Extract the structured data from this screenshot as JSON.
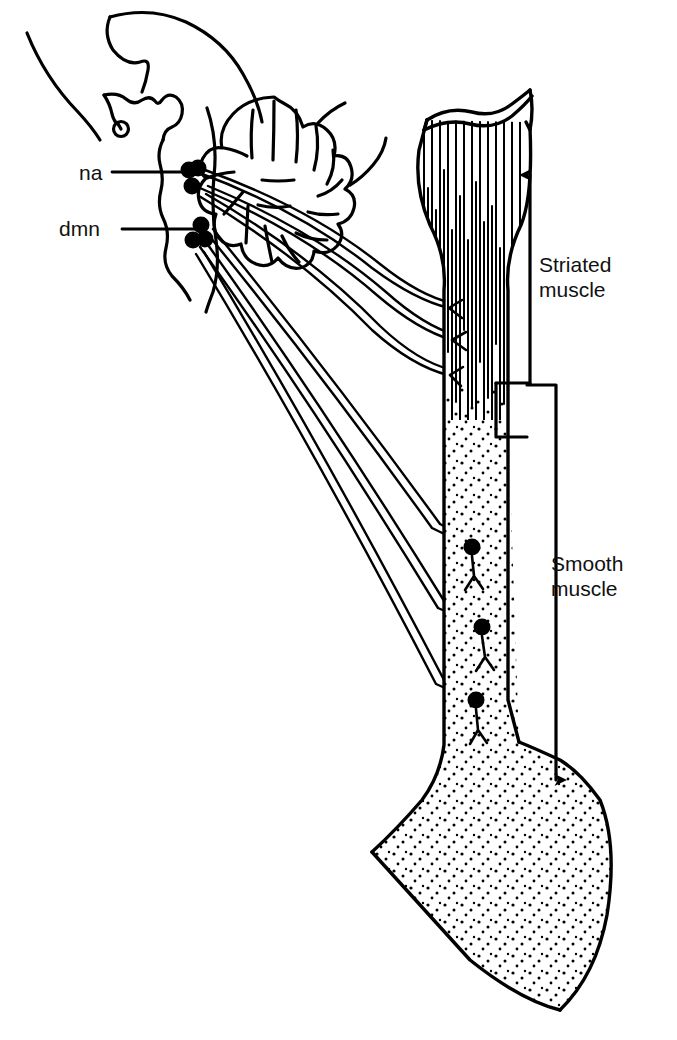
{
  "figure": {
    "kind": "anatomical-line-diagram",
    "background_color": "#ffffff",
    "ink_color": "#000000",
    "labels": {
      "na": "na",
      "dmn": "dmn",
      "striated_muscle": "Striated\nmuscle",
      "smooth_muscle": "Smooth\nmuscle"
    },
    "structures": [
      {
        "name": "head-outline",
        "description": "sagittal head and brainstem contour"
      },
      {
        "name": "cerebellum",
        "description": "foliated cerebellum"
      },
      {
        "name": "pituitary",
        "description": "small circle on infundibulum"
      },
      {
        "name": "nucleus-ambiguus",
        "abbr": "na",
        "neuron_count": 3
      },
      {
        "name": "dorsal-motor-nucleus",
        "abbr": "dmn",
        "neuron_count": 3
      },
      {
        "name": "esophagus",
        "description": "tube with striated upper and smooth lower portion"
      },
      {
        "name": "stomach",
        "description": "stippled fundus and body"
      },
      {
        "name": "motor-endplates",
        "count": 3
      },
      {
        "name": "postganglionic-neurons",
        "count": 3
      }
    ],
    "brackets": [
      {
        "name": "striated-muscle-bracket",
        "direction": "up",
        "label": "Striated muscle"
      },
      {
        "name": "smooth-muscle-bracket",
        "direction": "down",
        "label": "Smooth muscle"
      }
    ]
  }
}
